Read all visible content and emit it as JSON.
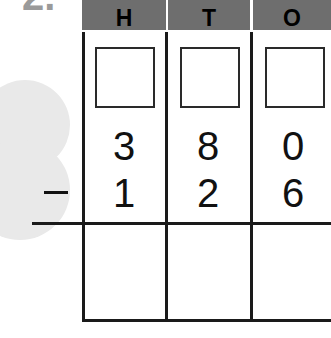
{
  "question": {
    "number": "2."
  },
  "place_value_headers": [
    "H",
    "T",
    "O"
  ],
  "header_color": "#6e6e6e",
  "regroup_boxes": [
    "",
    "",
    ""
  ],
  "minuend": [
    "3",
    "8",
    "0"
  ],
  "operator": "−",
  "subtrahend": [
    "1",
    "2",
    "6"
  ],
  "answer": [
    "",
    "",
    ""
  ]
}
